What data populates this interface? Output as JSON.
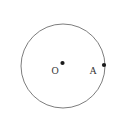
{
  "figure": {
    "background_color": "#ffffff",
    "circle_stroke_color": "#6e6e6e",
    "point_color": "#1a1a1a",
    "label_color": "#333333",
    "circle": {
      "cx": 63,
      "cy": 66,
      "r": 42
    },
    "center_point": {
      "label": "O",
      "cx": 62.5,
      "cy": 63,
      "dot_r": 2.1,
      "label_x": 51.5,
      "label_y": 74
    },
    "point_a": {
      "label": "A",
      "cx": 104,
      "cy": 65,
      "dot_r": 2.1,
      "label_x": 89.5,
      "label_y": 73.5
    }
  }
}
